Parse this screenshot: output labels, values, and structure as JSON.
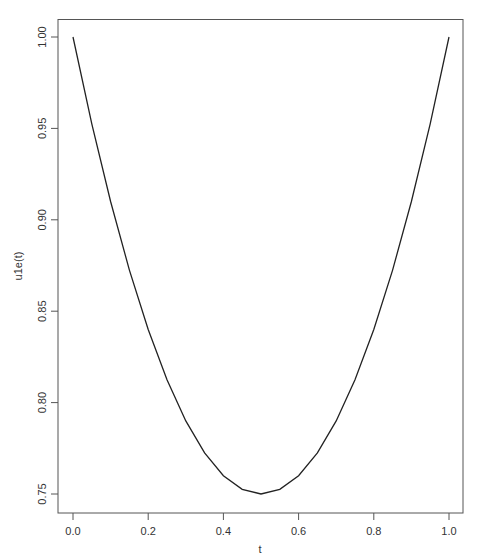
{
  "chart_data": {
    "type": "line",
    "title": "",
    "xlabel": "t",
    "ylabel": "u1e(t)",
    "xlim": [
      -0.04,
      1.04
    ],
    "ylim": [
      0.7398,
      1.0101
    ],
    "x_ticks": [
      0.0,
      0.2,
      0.4,
      0.6,
      0.8,
      1.0
    ],
    "x_tick_labels": [
      "0.0",
      "0.2",
      "0.4",
      "0.6",
      "0.8",
      "1.0"
    ],
    "y_ticks": [
      0.75,
      0.8,
      0.85,
      0.9,
      0.95,
      1.0
    ],
    "y_tick_labels": [
      "0.75",
      "0.80",
      "0.85",
      "0.90",
      "0.95",
      "1.00"
    ],
    "grid": false,
    "legend": null,
    "series": [
      {
        "name": "u1e(t)",
        "color": "#000000",
        "x": [
          0.0,
          0.05,
          0.1,
          0.15,
          0.2,
          0.25,
          0.3,
          0.35,
          0.4,
          0.45,
          0.5,
          0.55,
          0.6,
          0.65,
          0.7,
          0.75,
          0.8,
          0.85,
          0.9,
          0.95,
          1.0
        ],
        "values": [
          1.0,
          0.9525,
          0.91,
          0.8725,
          0.84,
          0.8125,
          0.79,
          0.7725,
          0.76,
          0.7525,
          0.75,
          0.7525,
          0.76,
          0.7725,
          0.79,
          0.8125,
          0.84,
          0.8725,
          0.91,
          0.9525,
          1.0
        ]
      }
    ]
  }
}
